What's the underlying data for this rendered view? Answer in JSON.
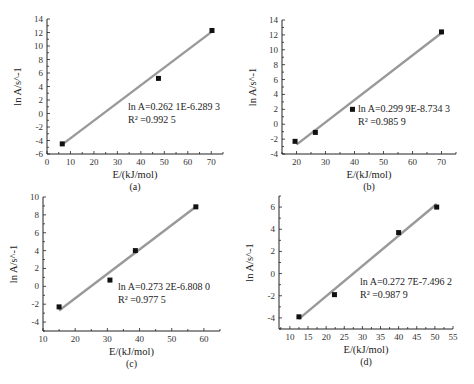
{
  "chart_data": [
    {
      "panel": "(a)",
      "type": "scatter",
      "xlabel": "E/(kJ/mol)",
      "ylabel": "ln A/s^-1",
      "xlim": [
        0,
        75
      ],
      "ylim": [
        -6,
        14
      ],
      "xticks": [
        0,
        10,
        20,
        30,
        40,
        50,
        60,
        70
      ],
      "yticks": [
        -6,
        -4,
        -2,
        0,
        2,
        4,
        6,
        8,
        10,
        12,
        14
      ],
      "points": [
        [
          6.5,
          -4.5
        ],
        [
          47.5,
          5.2
        ],
        [
          70.3,
          12.3
        ]
      ],
      "fit": {
        "slope": 0.2621,
        "intercept": -6.2893,
        "x_range": [
          6,
          70
        ]
      },
      "equation": "ln A=0.262 1E-6.289 3",
      "r2_label": "R² =0.992 5",
      "caption": "(a)",
      "grid": false
    },
    {
      "panel": "(b)",
      "type": "scatter",
      "xlabel": "E/(kJ/mol)",
      "ylabel": "ln A/s^-1",
      "xlim": [
        15,
        75
      ],
      "ylim": [
        -4,
        14
      ],
      "xticks": [
        20,
        30,
        40,
        50,
        60,
        70
      ],
      "yticks": [
        -4,
        -2,
        0,
        2,
        4,
        6,
        8,
        10,
        12,
        14
      ],
      "points": [
        [
          19.5,
          -2.3
        ],
        [
          26.5,
          -1.1
        ],
        [
          39.3,
          2.0
        ],
        [
          70.0,
          12.4
        ]
      ],
      "fit": {
        "slope": 0.2999,
        "intercept": -8.7343,
        "x_range": [
          20,
          70
        ]
      },
      "equation": "ln A=0.299 9E-8.734 3",
      "r2_label": "R² =0.985 9",
      "caption": "(b)",
      "grid": false
    },
    {
      "panel": "(c)",
      "type": "scatter",
      "xlabel": "E/(kJ/mol)",
      "ylabel": "ln A/s^-1",
      "xlim": [
        10,
        65
      ],
      "ylim": [
        -5,
        10
      ],
      "xticks": [
        10,
        20,
        30,
        40,
        50,
        60
      ],
      "yticks": [
        -4,
        -2,
        0,
        2,
        4,
        6,
        8,
        10
      ],
      "points": [
        [
          15.0,
          -2.3
        ],
        [
          30.8,
          0.7
        ],
        [
          38.7,
          4.0
        ],
        [
          57.5,
          8.9
        ]
      ],
      "fit": {
        "slope": 0.2732,
        "intercept": -6.808,
        "x_range": [
          15,
          57.5
        ]
      },
      "equation": "ln A=0.273 2E-6.808 0",
      "r2_label": "R² =0.977 5",
      "caption": "(c)",
      "grid": false
    },
    {
      "panel": "(d)",
      "type": "scatter",
      "xlabel": "E/(kJ/mol)",
      "ylabel": "ln A/s^-1",
      "xlim": [
        7,
        55
      ],
      "ylim": [
        -5,
        7
      ],
      "xticks": [
        10,
        15,
        20,
        25,
        30,
        35,
        40,
        45,
        50,
        55
      ],
      "yticks": [
        -4,
        -2,
        0,
        2,
        4,
        6
      ],
      "points": [
        [
          12.5,
          -3.9
        ],
        [
          22.3,
          -1.9
        ],
        [
          40.0,
          3.7
        ],
        [
          50.5,
          6.0
        ]
      ],
      "fit": {
        "slope": 0.2727,
        "intercept": -7.4962,
        "x_range": [
          12.5,
          50.5
        ]
      },
      "equation": "ln A=0.272 7E-7.496 2",
      "r2_label": "R² =0.987 9",
      "caption": "(d)",
      "grid": false
    }
  ],
  "layout": [
    {
      "x0": 47,
      "x1": 223,
      "y0": 154,
      "y1": 19
    },
    {
      "x0": 282,
      "x1": 456,
      "y0": 154,
      "y1": 20
    },
    {
      "x0": 43,
      "x1": 220,
      "y0": 331,
      "y1": 197
    },
    {
      "x0": 279,
      "x1": 453,
      "y0": 329,
      "y1": 196
    }
  ],
  "eq_pos": [
    {
      "x": 128,
      "y": 110
    },
    {
      "x": 358,
      "y": 112
    },
    {
      "x": 118,
      "y": 290
    },
    {
      "x": 360,
      "y": 285
    }
  ],
  "colors": {
    "axis": "#222222",
    "fit_line": "#999999",
    "marker": "#111111"
  }
}
